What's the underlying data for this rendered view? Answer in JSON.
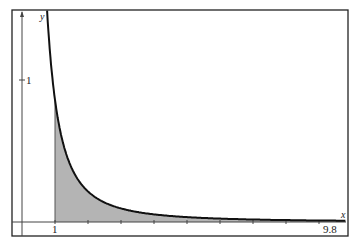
{
  "chart_data": {
    "type": "area",
    "title": "",
    "xlabel": "x",
    "ylabel": "y",
    "function_description": "decreasing curve approximately y = 0.86 / x^2 (shaded area under curve from x = 1 to x = 9.8)",
    "x_tick_labels": [
      "1",
      "9.8"
    ],
    "y_tick_labels": [
      "1"
    ],
    "x_ticks": [
      1,
      2,
      3,
      4,
      5,
      6,
      7,
      8,
      9
    ],
    "xlim": [
      0,
      9.8
    ],
    "ylim": [
      0,
      1.5
    ],
    "shaded_interval": [
      1,
      9.8
    ],
    "series": [
      {
        "name": "f(x)",
        "x": [
          0.76,
          1,
          1.5,
          2,
          2.5,
          3,
          4,
          5,
          6,
          7,
          8,
          9,
          9.8
        ],
        "y": [
          1.49,
          0.86,
          0.38,
          0.215,
          0.138,
          0.096,
          0.054,
          0.034,
          0.024,
          0.018,
          0.013,
          0.011,
          0.009
        ]
      }
    ],
    "grid": false,
    "legend": "none",
    "colors": {
      "curve": "#111111",
      "fill": "#b4b4b4",
      "axes": "#333333",
      "frame": "#222222"
    }
  }
}
